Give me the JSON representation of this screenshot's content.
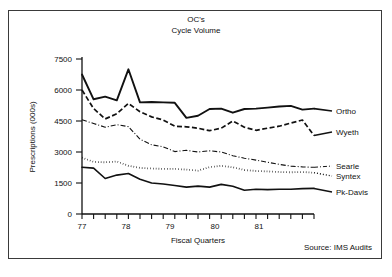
{
  "chart_data": {
    "type": "line",
    "title": "OC's\nCycle Volume",
    "title_line1": "OC's",
    "title_line2": "Cycle Volume",
    "xlabel": "Fiscal Quarters",
    "ylabel": "Prescriptions (000s)",
    "source": "Source: IMS Audits",
    "ylim": [
      0,
      7500
    ],
    "yticks": [
      0,
      1500,
      3000,
      4500,
      6000,
      7500
    ],
    "ytick_labels": [
      "0",
      "1500",
      "3000",
      "4500",
      "6000",
      "7500"
    ],
    "grid": false,
    "legend_position": "right-inline",
    "xtick_labels": [
      "77",
      "78",
      "79",
      "80",
      "81"
    ],
    "xtick_label_positions": [
      0,
      4,
      8,
      12,
      16
    ],
    "x_minor_ticks": 21,
    "x": [
      0,
      1,
      2,
      3,
      4,
      5,
      6,
      7,
      8,
      9,
      10,
      11,
      12,
      13,
      14,
      15,
      16,
      17,
      18,
      19,
      20
    ],
    "series": [
      {
        "name": "Ortho",
        "style": "solid-thick",
        "color": "#111111",
        "values": [
          6750,
          5550,
          5680,
          5500,
          7000,
          5400,
          5420,
          5400,
          5380,
          4650,
          4750,
          5080,
          5100,
          4900,
          5080,
          5100,
          5150,
          5200,
          5230,
          5050,
          5100
        ]
      },
      {
        "name": "Wyeth",
        "style": "dashed",
        "color": "#111111",
        "values": [
          6000,
          5100,
          4600,
          4850,
          5350,
          4950,
          4700,
          4550,
          4250,
          4220,
          4150,
          4030,
          4150,
          4500,
          4200,
          4050,
          4150,
          4250,
          4400,
          4550,
          3800
        ]
      },
      {
        "name": "Searle",
        "style": "dash-dot",
        "color": "#111111",
        "values": [
          4560,
          4380,
          4200,
          4320,
          4230,
          3620,
          3350,
          3250,
          3020,
          3080,
          3000,
          3060,
          3000,
          2820,
          2700,
          2610,
          2500,
          2400,
          2320,
          2280,
          2260
        ]
      },
      {
        "name": "Syntex",
        "style": "dotted",
        "color": "#111111",
        "values": [
          2730,
          2520,
          2500,
          2540,
          2330,
          2230,
          2200,
          2180,
          2180,
          2150,
          2100,
          2270,
          2330,
          2260,
          2130,
          2080,
          2060,
          2030,
          2020,
          2030,
          2000
        ]
      },
      {
        "name": "Pk-Davis",
        "style": "solid",
        "color": "#111111",
        "values": [
          2260,
          2220,
          1720,
          1880,
          1960,
          1680,
          1500,
          1450,
          1380,
          1300,
          1350,
          1300,
          1430,
          1340,
          1150,
          1200,
          1180,
          1200,
          1200,
          1230,
          1240
        ]
      }
    ],
    "legend_labels": {
      "ortho": "Ortho",
      "wyeth": "Wyeth",
      "searle": "Searle",
      "syntex": "Syntex",
      "pkdavis": "Pk-Davis"
    }
  }
}
